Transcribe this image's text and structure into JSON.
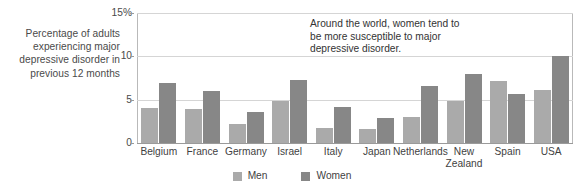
{
  "caption": "Percentage\nof adults\nexperiencing\nmajor depressive\ndisorder in\nprevious\n12 months",
  "annotation": "Around the world, women tend to be more susceptible to major depressive disorder.",
  "legend": {
    "men": {
      "label": "Men",
      "color": "#aaaaaa"
    },
    "women": {
      "label": "Women",
      "color": "#878787"
    }
  },
  "axis": {
    "y_ticks": [
      "15%",
      "10",
      "5",
      "0"
    ],
    "y_tick_values": [
      15,
      10,
      5,
      0
    ]
  },
  "chart_data": {
    "type": "bar",
    "title": "",
    "subtitle": "",
    "xlabel": "",
    "ylabel": "Percentage of adults experiencing major depressive disorder in previous 12 months",
    "ylim": [
      0,
      15
    ],
    "ytick_labels": [
      "0",
      "5",
      "10",
      "15%"
    ],
    "grid": true,
    "legend_position": "bottom-center",
    "annotations": [
      "Around the world, women tend to be more susceptible to major depressive disorder."
    ],
    "categories": [
      "Belgium",
      "France",
      "Germany",
      "Israel",
      "Italy",
      "Japan",
      "Netherlands",
      "New Zealand",
      "Spain",
      "USA"
    ],
    "series": [
      {
        "name": "Men",
        "color": "#aaaaaa",
        "values": [
          4.0,
          3.9,
          2.2,
          4.8,
          1.7,
          1.6,
          3.0,
          4.8,
          7.2,
          6.1
        ]
      },
      {
        "name": "Women",
        "color": "#878787",
        "values": [
          6.9,
          6.0,
          3.6,
          7.3,
          4.2,
          2.9,
          6.6,
          8.0,
          5.7,
          10.0
        ]
      }
    ]
  }
}
